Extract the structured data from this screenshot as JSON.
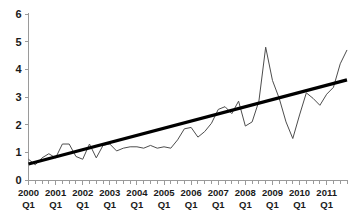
{
  "chart_data": {
    "type": "line",
    "title": "",
    "subtitle": "",
    "xlabel": "",
    "ylabel": "",
    "ylim": [
      0,
      6
    ],
    "yticks": [
      0,
      1,
      2,
      3,
      4,
      5,
      6
    ],
    "ytick_labels": [
      "0",
      "1",
      "2",
      "3",
      "4",
      "5",
      "6"
    ],
    "grid": false,
    "legend": "none",
    "x_tick_labels": [
      "2000\nQ1",
      "2001\nQ1",
      "2002\nQ1",
      "2003\nQ1",
      "2004\nQ1",
      "2005\nQ1",
      "2006\nQ1",
      "2007\nQ1",
      "2008\nQ1",
      "2009\nQ1",
      "2010\nQ1",
      "2011\nQ1"
    ],
    "x_tick_label_years": [
      "2000",
      "2001",
      "2002",
      "2003",
      "2004",
      "2005",
      "2006",
      "2007",
      "2008",
      "2009",
      "2010",
      "2011"
    ],
    "x_tick_label_quarter": "Q1",
    "x_minor_ticks_per_label": 4,
    "x": [
      "2000 Q1",
      "2000 Q2",
      "2000 Q3",
      "2000 Q4",
      "2001 Q1",
      "2001 Q2",
      "2001 Q3",
      "2001 Q4",
      "2002 Q1",
      "2002 Q2",
      "2002 Q3",
      "2002 Q4",
      "2003 Q1",
      "2003 Q2",
      "2003 Q3",
      "2003 Q4",
      "2004 Q1",
      "2004 Q2",
      "2004 Q3",
      "2004 Q4",
      "2005 Q1",
      "2005 Q2",
      "2005 Q3",
      "2005 Q4",
      "2006 Q1",
      "2006 Q2",
      "2006 Q3",
      "2006 Q4",
      "2007 Q1",
      "2007 Q2",
      "2007 Q3",
      "2007 Q4",
      "2008 Q1",
      "2008 Q2",
      "2008 Q3",
      "2008 Q4",
      "2009 Q1",
      "2009 Q2",
      "2009 Q3",
      "2009 Q4",
      "2010 Q1",
      "2010 Q2",
      "2010 Q3",
      "2010 Q4",
      "2011 Q1",
      "2011 Q2",
      "2011 Q3",
      "2011 Q4"
    ],
    "series": [
      {
        "name": "observed",
        "color": "#4d4d4d",
        "style": "thin-line",
        "values": [
          0.75,
          0.55,
          0.8,
          0.95,
          0.8,
          1.3,
          1.3,
          0.85,
          0.75,
          1.3,
          0.8,
          1.25,
          1.3,
          1.05,
          1.15,
          1.2,
          1.2,
          1.15,
          1.25,
          1.15,
          1.2,
          1.15,
          1.45,
          1.85,
          1.9,
          1.55,
          1.75,
          2.05,
          2.55,
          2.65,
          2.4,
          2.85,
          1.95,
          2.1,
          2.85,
          4.8,
          3.6,
          2.95,
          2.1,
          1.5,
          2.35,
          3.15,
          2.95,
          2.7,
          3.1,
          3.35,
          4.2,
          4.7
        ]
      },
      {
        "name": "linear-trend",
        "color": "#000000",
        "style": "thick-line",
        "start_value": 0.58,
        "end_value": 3.62
      }
    ]
  }
}
